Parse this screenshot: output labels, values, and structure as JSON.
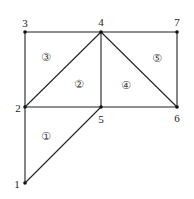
{
  "diagram": {
    "type": "triangular-mesh",
    "colors": {
      "line": "#222222",
      "node": "#111111",
      "background": "#ffffff"
    },
    "nodes": [
      {
        "id": "1",
        "label": "1",
        "x": 25,
        "y": 183,
        "lx": 17,
        "ly": 184
      },
      {
        "id": "2",
        "label": "2",
        "x": 25,
        "y": 107,
        "lx": 18,
        "ly": 108
      },
      {
        "id": "3",
        "label": "3",
        "x": 25,
        "y": 32,
        "lx": 25,
        "ly": 23
      },
      {
        "id": "4",
        "label": "4",
        "x": 101,
        "y": 32,
        "lx": 101,
        "ly": 22
      },
      {
        "id": "5",
        "label": "5",
        "x": 101,
        "y": 107,
        "lx": 101,
        "ly": 119
      },
      {
        "id": "6",
        "label": "6",
        "x": 177,
        "y": 107,
        "lx": 177,
        "ly": 118
      },
      {
        "id": "7",
        "label": "7",
        "x": 177,
        "y": 32,
        "lx": 177,
        "ly": 22
      }
    ],
    "edges": [
      [
        "1",
        "2"
      ],
      [
        "1",
        "5"
      ],
      [
        "2",
        "5"
      ],
      [
        "2",
        "3"
      ],
      [
        "2",
        "4"
      ],
      [
        "3",
        "4"
      ],
      [
        "4",
        "5"
      ],
      [
        "4",
        "7"
      ],
      [
        "4",
        "6"
      ],
      [
        "5",
        "6"
      ],
      [
        "6",
        "7"
      ]
    ],
    "elements": [
      {
        "id": "1",
        "label": "①",
        "nodes": [
          "1",
          "5",
          "2"
        ],
        "x": 46,
        "y": 136
      },
      {
        "id": "2",
        "label": "②",
        "nodes": [
          "2",
          "5",
          "4"
        ],
        "x": 79,
        "y": 84
      },
      {
        "id": "3",
        "label": "③",
        "nodes": [
          "2",
          "4",
          "3"
        ],
        "x": 46,
        "y": 57
      },
      {
        "id": "4",
        "label": "④",
        "nodes": [
          "5",
          "6",
          "4"
        ],
        "x": 126,
        "y": 85
      },
      {
        "id": "5",
        "label": "⑤",
        "nodes": [
          "4",
          "6",
          "7"
        ],
        "x": 157,
        "y": 58
      }
    ]
  }
}
